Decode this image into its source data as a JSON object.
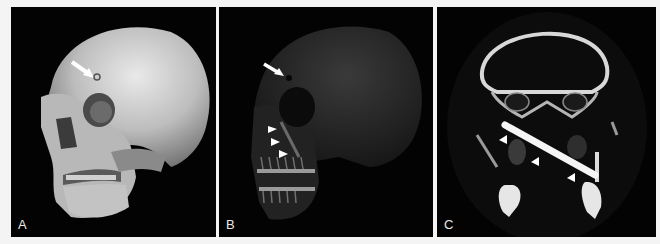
{
  "figure": {
    "background": "#f4f4f4",
    "panels": [
      {
        "id": "A",
        "label": "A",
        "content": "3D volume-rendered CT of skull, left anterolateral view (opaque bone surface)",
        "annotations": [
          {
            "type": "arrow",
            "target": "small entry defect on left frontal bone"
          }
        ]
      },
      {
        "id": "B",
        "label": "B",
        "content": "3D CT rendering with transparency showing foreign body track",
        "annotations": [
          {
            "type": "arrow",
            "target": "frontal bone entry defect"
          },
          {
            "type": "arrowheads",
            "count": 3,
            "target": "linear foreign body through maxilla"
          }
        ]
      },
      {
        "id": "C",
        "label": "C",
        "content": "Coronal CT slice showing hyperdense linear foreign body traversing skull base / infratemporal region",
        "annotations": [
          {
            "type": "arrowheads",
            "count": 3,
            "target": "linear foreign body"
          }
        ]
      }
    ]
  }
}
